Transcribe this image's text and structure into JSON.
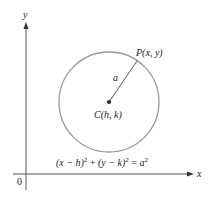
{
  "diagram": {
    "axes": {
      "x_label": "x",
      "y_label": "y",
      "origin_label": "0",
      "color": "#555555"
    },
    "circle": {
      "center_label": "C(h, k)",
      "point_label": "P(x, y)",
      "radius_label": "a",
      "stroke_color": "#9a9a9a"
    },
    "equation": {
      "lhs_part1": "(x − h)",
      "exp1": "2",
      "plus": " + ",
      "lhs_part2": "(y − k)",
      "exp2": "2",
      "equals": " = ",
      "rhs": "a",
      "exp3": "2",
      "full_text": "(x − h)² + (y − k)² = a²"
    }
  }
}
